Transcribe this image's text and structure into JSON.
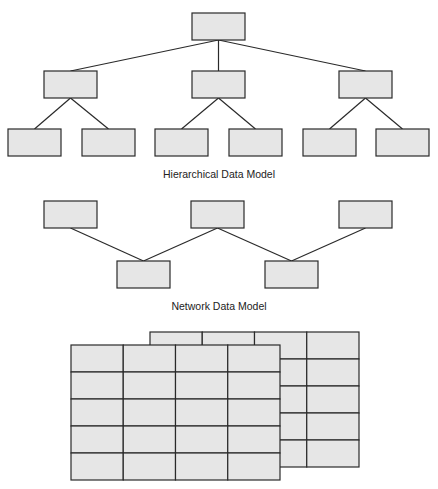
{
  "hierarchical": {
    "caption": "Hierarchical Data Model",
    "nodes": [
      {
        "id": "root",
        "level": 0,
        "parent": null
      },
      {
        "id": "a",
        "level": 1,
        "parent": "root"
      },
      {
        "id": "b",
        "level": 1,
        "parent": "root"
      },
      {
        "id": "c",
        "level": 1,
        "parent": "root"
      },
      {
        "id": "a1",
        "level": 2,
        "parent": "a"
      },
      {
        "id": "a2",
        "level": 2,
        "parent": "a"
      },
      {
        "id": "b1",
        "level": 2,
        "parent": "b"
      },
      {
        "id": "b2",
        "level": 2,
        "parent": "b"
      },
      {
        "id": "c1",
        "level": 2,
        "parent": "c"
      },
      {
        "id": "c2",
        "level": 2,
        "parent": "c"
      }
    ]
  },
  "network": {
    "caption": "Network Data Model",
    "top_nodes": [
      "n1",
      "n2",
      "n3"
    ],
    "bottom_nodes": [
      "m1",
      "m2"
    ],
    "links": [
      [
        "n1",
        "m1"
      ],
      [
        "n2",
        "m1"
      ],
      [
        "n2",
        "m2"
      ],
      [
        "n3",
        "m2"
      ]
    ]
  },
  "relational": {
    "caption": "",
    "tables": [
      {
        "name": "back-table",
        "rows": 5,
        "cols": 4
      },
      {
        "name": "front-table",
        "rows": 5,
        "cols": 4
      }
    ]
  }
}
